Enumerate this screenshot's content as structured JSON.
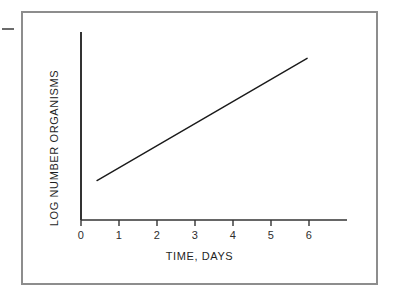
{
  "figure": {
    "background_color": "#ffffff",
    "frame_color": "#8d8d8d",
    "edge_mark": "dash-mark"
  },
  "chart_data": {
    "type": "line",
    "title": "",
    "subtitle": "",
    "xlabel": "TIME, DAYS",
    "ylabel": "LOG NUMBER ORGANISMS",
    "xlim": [
      0,
      7
    ],
    "ylim": [
      0,
      10
    ],
    "x_ticks": [
      0,
      1,
      2,
      3,
      4,
      5,
      6
    ],
    "x_tick_labels": [
      "0",
      "1",
      "2",
      "3",
      "4",
      "5",
      "6"
    ],
    "y_ticks": [],
    "y_tick_labels": [],
    "grid": false,
    "legend": false,
    "legend_position": "none",
    "annotations": [],
    "series": [
      {
        "name": "Exponential growth phase",
        "color": "#1a1a1a",
        "line_width": 1.4,
        "x": [
          0.42,
          5.95
        ],
        "y": [
          2.1,
          8.6
        ],
        "points": [
          {
            "x": 0.42,
            "y": 2.1
          },
          {
            "x": 5.95,
            "y": 8.6
          }
        ]
      }
    ],
    "axis_color": "#333333",
    "line_color": "#1a1a1a"
  },
  "axes": {
    "x_axis_label": "TIME, DAYS",
    "y_axis_label": "LOG NUMBER ORGANISMS",
    "tick_labels": [
      "0",
      "1",
      "2",
      "3",
      "4",
      "5",
      "6"
    ]
  }
}
